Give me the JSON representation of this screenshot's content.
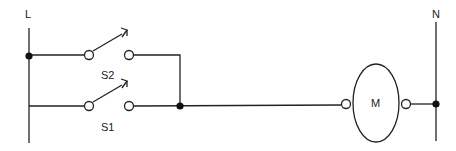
{
  "diagram": {
    "type": "ladder-circuit",
    "rails": {
      "left_label": "L",
      "right_label": "N"
    },
    "switches": [
      {
        "id": "S2",
        "label": "S2",
        "type": "normally-open pushbutton",
        "rung": 1
      },
      {
        "id": "S1",
        "label": "S1",
        "type": "normally-open pushbutton",
        "rung": 2
      }
    ],
    "load": {
      "id": "M",
      "label": "M",
      "type": "motor/coil"
    },
    "connection": "S1 and S2 in parallel, in series with M between L and N",
    "colors": {
      "line": "#222222",
      "background": "#ffffff"
    }
  }
}
